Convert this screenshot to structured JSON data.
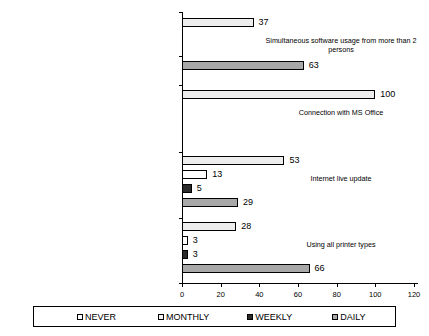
{
  "chart_data": {
    "type": "bar",
    "orientation": "horizontal",
    "title": "",
    "subtitle": "",
    "xlabel": "",
    "ylabel": "",
    "xlim": [
      0,
      120
    ],
    "xticks": [
      0,
      20,
      40,
      60,
      80,
      100,
      120
    ],
    "xtick_labels": [
      "0",
      "20",
      "40",
      "60",
      "80",
      "100",
      "120"
    ],
    "grid": false,
    "legend_position": "bottom",
    "categories": [
      "Simultaneous software usage from more than 2 persons",
      "Connection with MS Office",
      "Internet live update",
      "Using all printer types"
    ],
    "series": [
      {
        "name": "NEVER",
        "color": "#ededed",
        "values": [
          37,
          100,
          53,
          28
        ]
      },
      {
        "name": "MONTHLY",
        "color": "#ffffff",
        "values": [
          0,
          0,
          13,
          3
        ]
      },
      {
        "name": "WEEKLY",
        "color": "#2b2b2b",
        "values": [
          0,
          0,
          5,
          3
        ]
      },
      {
        "name": "DAILY",
        "color": "#a8a8a8",
        "values": [
          63,
          0,
          29,
          66
        ]
      }
    ],
    "data_labels": {
      "group_1": [
        "37",
        "",
        "",
        "63"
      ],
      "group_2": [
        "100",
        "",
        "",
        ""
      ],
      "group_3": [
        "53",
        "13",
        "5",
        "29"
      ],
      "group_4": [
        "28",
        "3",
        "3",
        "66"
      ]
    }
  },
  "legend": {
    "items": [
      {
        "label": "NEVER",
        "swatch": "never-swatch"
      },
      {
        "label": "MONTHLY",
        "swatch": "monthly-swatch"
      },
      {
        "label": "WEEKLY",
        "swatch": "weekly-swatch"
      },
      {
        "label": "DAILY",
        "swatch": "daily-swatch"
      }
    ]
  },
  "axis": {
    "x_tick_labels": [
      "0",
      "20",
      "40",
      "60",
      "80",
      "100",
      "120"
    ]
  },
  "categories": {
    "c0": "Simultaneous software usage from more than 2 persons",
    "c1": "Connection with MS Office",
    "c2": "Internet live update",
    "c3": "Using all printer types"
  },
  "values": {
    "g0_never": "37",
    "g0_daily": "63",
    "g1_never": "100",
    "g2_never": "53",
    "g2_monthly": "13",
    "g2_weekly": "5",
    "g2_daily": "29",
    "g3_never": "28",
    "g3_monthly": "3",
    "g3_weekly": "3",
    "g3_daily": "66"
  }
}
